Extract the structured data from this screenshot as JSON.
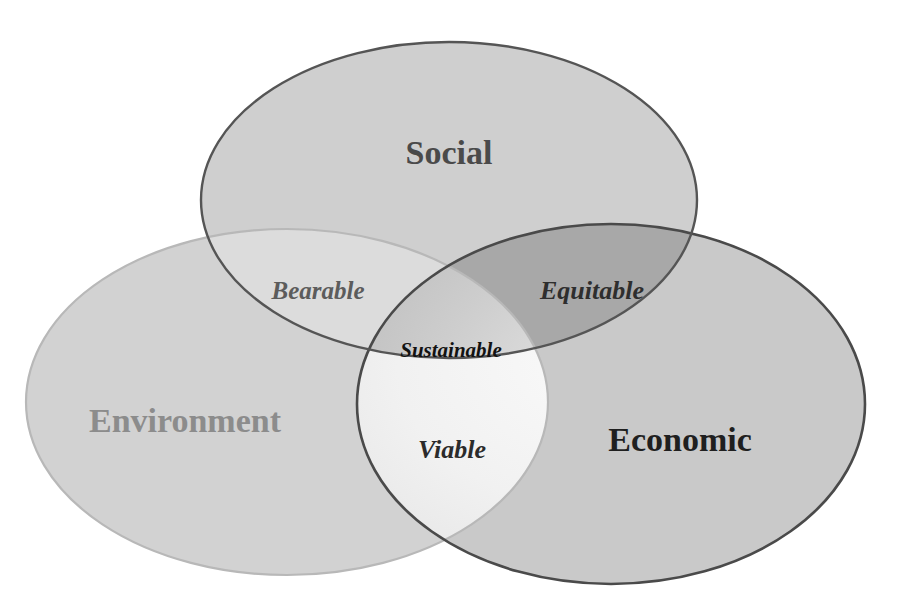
{
  "diagram": {
    "type": "venn-3-set",
    "background_color": "#ffffff",
    "sets": [
      {
        "id": "social",
        "label": "Social",
        "label_color": "#4a4a4a",
        "fill_color": "#cfcfcf",
        "stroke_color": "#555555",
        "position": "top-center"
      },
      {
        "id": "environment",
        "label": "Environment",
        "label_color": "#8c8c8c",
        "fill_color": "#d2d2d2",
        "stroke_color": "#b8b8b8",
        "position": "bottom-left"
      },
      {
        "id": "economic",
        "label": "Economic",
        "label_color": "#1f1f1f",
        "fill_color": "#c9c9c9",
        "stroke_color": "#4a4a4a",
        "position": "bottom-right"
      }
    ],
    "intersections": [
      {
        "id": "bearable",
        "label": "Bearable",
        "label_color": "#5c5c5c",
        "fill_color": "#dcdcdc",
        "sets": [
          "social",
          "environment"
        ]
      },
      {
        "id": "equitable",
        "label": "Equitable",
        "label_color": "#2e2e2e",
        "fill_color": "#a8a8a8",
        "sets": [
          "social",
          "economic"
        ]
      },
      {
        "id": "viable",
        "label": "Viable",
        "label_color": "#2b2b2b",
        "fill_color": "#f0f0f0",
        "sets": [
          "environment",
          "economic"
        ]
      },
      {
        "id": "sustainable",
        "label": "Sustainable",
        "label_color": "#121212",
        "fill_color": "#c4c4c4",
        "sets": [
          "social",
          "environment",
          "economic"
        ]
      }
    ]
  }
}
